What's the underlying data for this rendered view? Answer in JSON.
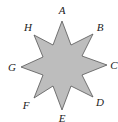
{
  "diagram": {
    "type": "eight-pointed-star",
    "fill_color": "#bdbdbd",
    "stroke_color": "#555555",
    "points": [
      {
        "label": "A",
        "tip": [
          62,
          21
        ],
        "label_pos": [
          62,
          14
        ]
      },
      {
        "label": "B",
        "tip": [
          93,
          34
        ],
        "label_pos": [
          100,
          31
        ]
      },
      {
        "label": "C",
        "tip": [
          107,
          65
        ],
        "label_pos": [
          114,
          69
        ]
      },
      {
        "label": "D",
        "tip": [
          93,
          97
        ],
        "label_pos": [
          100,
          106
        ]
      },
      {
        "label": "E",
        "tip": [
          62,
          110
        ],
        "label_pos": [
          62,
          122
        ]
      },
      {
        "label": "F",
        "tip": [
          34,
          98
        ],
        "label_pos": [
          26,
          109
        ]
      },
      {
        "label": "G",
        "tip": [
          21,
          67
        ],
        "label_pos": [
          12,
          71
        ]
      },
      {
        "label": "H",
        "tip": [
          34,
          35
        ],
        "label_pos": [
          28,
          31
        ]
      }
    ],
    "inner_vertices": [
      [
        71,
        45
      ],
      [
        82,
        56
      ],
      [
        82,
        75
      ],
      [
        71,
        86
      ],
      [
        53,
        86
      ],
      [
        43,
        75
      ],
      [
        43,
        57
      ],
      [
        53,
        45
      ]
    ]
  }
}
